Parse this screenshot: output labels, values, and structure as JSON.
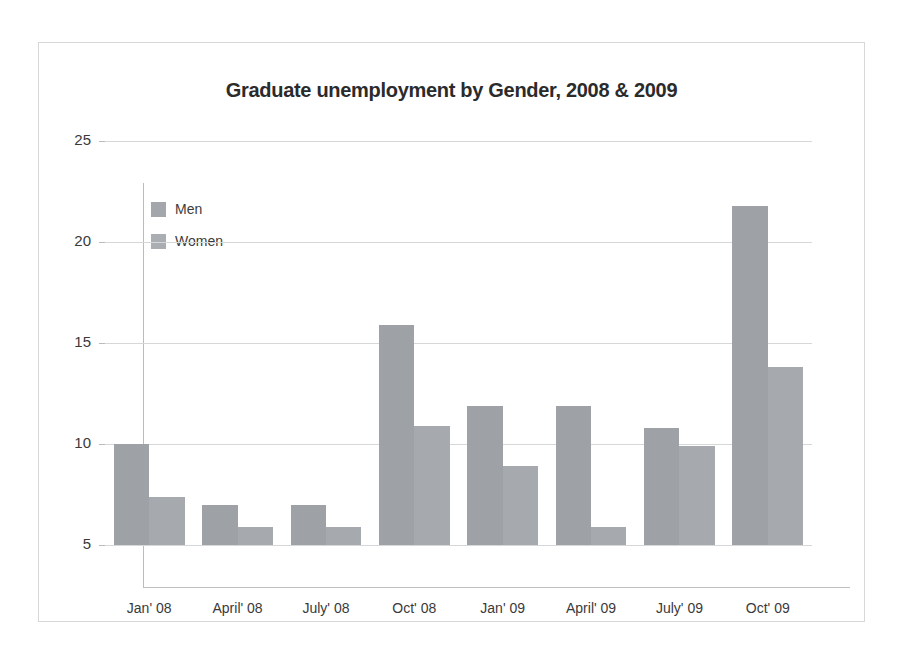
{
  "chart_data": {
    "type": "bar",
    "title": "Graduate unemployment by Gender, 2008 & 2009",
    "xlabel": "",
    "ylabel": "",
    "ylim": [
      5,
      25
    ],
    "yticks": [
      5,
      10,
      15,
      20,
      25
    ],
    "grid": true,
    "legend_position": "top-left-inside",
    "categories": [
      "Jan' 08",
      "April' 08",
      "July' 08",
      "Oct' 08",
      "Jan' 09",
      "April' 09",
      "July' 09",
      "Oct' 09"
    ],
    "series": [
      {
        "name": "Men",
        "values": [
          10.0,
          7.0,
          7.0,
          15.9,
          11.9,
          11.9,
          10.8,
          21.8
        ],
        "color": "#9ea2a6"
      },
      {
        "name": "Women",
        "values": [
          7.4,
          5.9,
          5.9,
          10.9,
          8.9,
          5.9,
          9.9,
          13.8
        ],
        "color": "#a6a9ad"
      }
    ]
  },
  "axis": {
    "y_tick_labels": [
      "25",
      "20",
      "15",
      "10",
      "5"
    ]
  },
  "legend": {
    "items": [
      {
        "label": "Men"
      },
      {
        "label": "Women"
      }
    ]
  },
  "colors": {
    "bar_men": "#9ea2a6",
    "bar_women": "#a6a9ad",
    "gridline": "#d5d7d9",
    "axis": "#bcbec0",
    "frame": "#d8d8da",
    "text": "#3a3a3a",
    "title": "#2b2b2b",
    "background": "#ffffff"
  }
}
